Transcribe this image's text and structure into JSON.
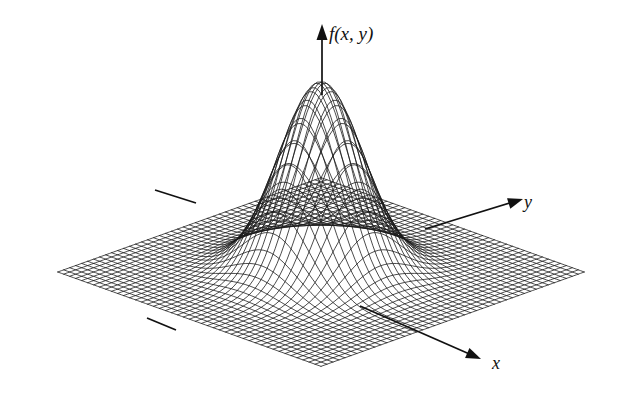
{
  "figure": {
    "title": "",
    "background_color": "#ffffff",
    "ink_color": "#111111"
  },
  "axes": {
    "vertical": {
      "name": "f-axis",
      "label": "f(x, y)",
      "label_x": 329,
      "label_y": 40,
      "line_x": 322,
      "line_y_top": 32,
      "line_y_bottom": 95,
      "arrow": "up"
    },
    "depth_right": {
      "name": "y-axis",
      "label": "y",
      "label_x": 524,
      "label_y": 208,
      "start_x": 425,
      "start_y": 229,
      "end_x": 516,
      "end_y": 201,
      "arrow": "right"
    },
    "depth_front": {
      "name": "x-axis",
      "label": "x",
      "label_x": 492,
      "label_y": 369,
      "start_x": 360,
      "start_y": 306,
      "end_x": 474,
      "end_y": 356,
      "arrow": "down-right"
    },
    "negative_y_stub": {
      "name": "negative-y-stub",
      "start_x": 155,
      "start_y": 190,
      "end_x": 196,
      "end_y": 203
    },
    "negative_x_stub": {
      "name": "negative-x-stub",
      "start_x": 147,
      "start_y": 318,
      "end_x": 176,
      "end_y": 330
    }
  },
  "chart_data": {
    "type": "surface",
    "title": "",
    "xlabel": "x",
    "ylabel": "y",
    "zlabel": "f(x, y)",
    "render_style": "wireframe-mesh",
    "mesh_lines_u": 44,
    "mesh_lines_v": 44,
    "domain": {
      "x": [
        -3.2,
        3.2
      ],
      "y": [
        -3.2,
        3.2
      ]
    },
    "zlim": [
      0,
      1
    ],
    "function_description": "gaussian-bell",
    "function_expression": "exp(-(x^2 + y^2) / 1.1)",
    "peak": {
      "x": 0,
      "y": 0,
      "z": 1.0
    },
    "baseline_z": 0,
    "grid": false,
    "legend": false,
    "ticks": false,
    "projection": {
      "origin_x": 321,
      "origin_y": 272,
      "scale_x": 44.0,
      "scale_y": 44.0,
      "shear_x": 0.935,
      "shear_y": 0.335,
      "height_scale": 190
    },
    "samples_note": "Radially symmetric bell; z falls from 1.0 at r=0 to ~0 by r=2.6",
    "radial_profile": {
      "r": [
        0.0,
        0.25,
        0.5,
        0.75,
        1.0,
        1.25,
        1.5,
        1.75,
        2.0,
        2.5,
        3.0,
        3.2
      ],
      "z": [
        1.0,
        0.945,
        0.797,
        0.603,
        0.404,
        0.242,
        0.13,
        0.063,
        0.027,
        0.003,
        0.0,
        0.0
      ]
    }
  }
}
